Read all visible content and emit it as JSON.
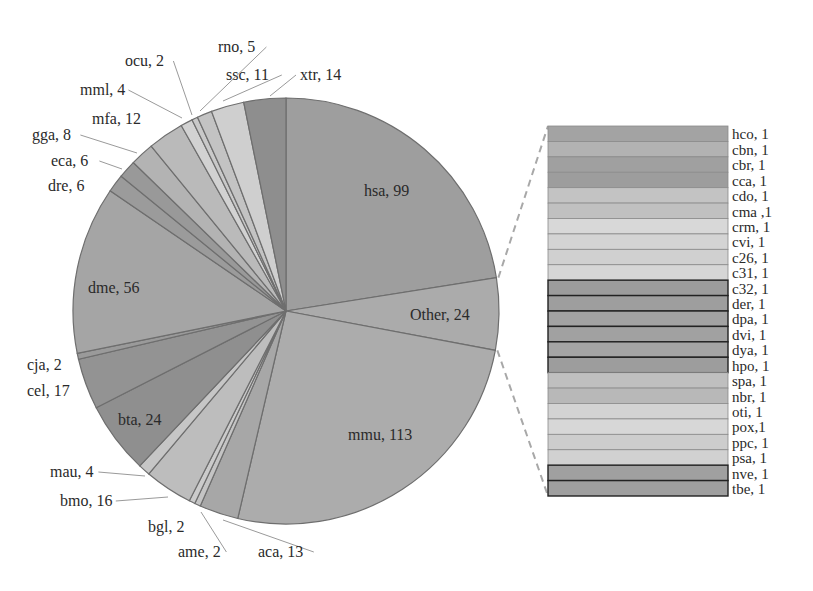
{
  "chart_data": {
    "type": "pie",
    "subtype": "pie-of-pie (bar of pie)",
    "title": "",
    "pie": {
      "order": "clockwise from 12 o'clock",
      "slices": [
        {
          "label": "hsa",
          "value": 99,
          "color": "#9e9e9e"
        },
        {
          "label": "Other",
          "value": 24,
          "color": "#ababab"
        },
        {
          "label": "mmu",
          "value": 113,
          "color": "#acacac"
        },
        {
          "label": "aca",
          "value": 13,
          "color": "#a7a7a7"
        },
        {
          "label": "ame",
          "value": 2,
          "color": "#c4c4c4"
        },
        {
          "label": "bgl",
          "value": 2,
          "color": "#cbcbcb"
        },
        {
          "label": "bmo",
          "value": 16,
          "color": "#bdbdbd"
        },
        {
          "label": "mau",
          "value": 4,
          "color": "#c6c6c6"
        },
        {
          "label": "bta",
          "value": 24,
          "color": "#8f8f8f"
        },
        {
          "label": "cel",
          "value": 17,
          "color": "#939393"
        },
        {
          "label": "cja",
          "value": 2,
          "color": "#9a9a9a"
        },
        {
          "label": "dme",
          "value": 56,
          "color": "#a5a5a5"
        },
        {
          "label": "dre",
          "value": 6,
          "color": "#9b9b9b"
        },
        {
          "label": "eca",
          "value": 6,
          "color": "#999999"
        },
        {
          "label": "gga",
          "value": 8,
          "color": "#b3b3b3"
        },
        {
          "label": "mfa",
          "value": 12,
          "color": "#bababa"
        },
        {
          "label": "mml",
          "value": 4,
          "color": "#d2d2d2"
        },
        {
          "label": "ocu",
          "value": 2,
          "color": "#c9c9c9"
        },
        {
          "label": "rno",
          "value": 5,
          "color": "#c3c3c3"
        },
        {
          "label": "ssc",
          "value": 11,
          "color": "#cfcfcf"
        },
        {
          "label": "xtr",
          "value": 14,
          "color": "#8e8e8e"
        }
      ],
      "labels_display": [
        {
          "text": "hsa, 99",
          "x": 364,
          "y": 196,
          "inside": true
        },
        {
          "text": "Other, 24",
          "x": 410,
          "y": 320,
          "inside": true
        },
        {
          "text": "mmu, 113",
          "x": 348,
          "y": 440,
          "inside": true
        },
        {
          "text": "dme, 56",
          "x": 88,
          "y": 293,
          "inside": true
        },
        {
          "text": "bta, 24",
          "x": 118,
          "y": 425,
          "inside": true
        },
        {
          "text": "xtr, 14",
          "x": 300,
          "y": 80,
          "lx": 270,
          "ly": 96
        },
        {
          "text": "ssc, 11",
          "x": 226,
          "y": 80,
          "lx": 223,
          "ly": 101
        },
        {
          "text": "rno, 5",
          "x": 218,
          "y": 52,
          "lx": 200,
          "ly": 111
        },
        {
          "text": "ocu, 2",
          "x": 125,
          "y": 66,
          "lx": 192,
          "ly": 115
        },
        {
          "text": "mml, 4",
          "x": 80,
          "y": 95,
          "lx": 182,
          "ly": 118
        },
        {
          "text": "mfa, 12",
          "x": 92,
          "y": 124,
          "lx": null,
          "ly": null
        },
        {
          "text": "gga, 8",
          "x": 32,
          "y": 140,
          "lx": 137,
          "ly": 153
        },
        {
          "text": "eca, 6",
          "x": 51,
          "y": 166,
          "lx": 122,
          "ly": 169
        },
        {
          "text": "dre, 6",
          "x": 48,
          "y": 191,
          "lx": null,
          "ly": null
        },
        {
          "text": "cja, 2",
          "x": 27,
          "y": 370,
          "lx": null,
          "ly": null
        },
        {
          "text": "cel, 17",
          "x": 27,
          "y": 396,
          "lx": null,
          "ly": null
        },
        {
          "text": "mau, 4",
          "x": 50,
          "y": 477,
          "lx": 145,
          "ly": 476
        },
        {
          "text": "bmo, 16",
          "x": 60,
          "y": 506,
          "lx": 168,
          "ly": 497
        },
        {
          "text": "bgl, 2",
          "x": 148,
          "y": 532,
          "lx": null,
          "ly": null
        },
        {
          "text": "ame, 2",
          "x": 178,
          "y": 557,
          "lx": 201,
          "ly": 512
        },
        {
          "text": "aca, 13",
          "x": 258,
          "y": 557,
          "lx": 223,
          "ly": 520
        }
      ]
    },
    "breakdown_bar": {
      "of_slice": "Other",
      "total": 24,
      "items": [
        {
          "label": "hco, 1",
          "name": "hco",
          "value": 1,
          "color": "#a3a3a3",
          "bold": false
        },
        {
          "label": "cbn, 1",
          "name": "cbn",
          "value": 1,
          "color": "#b2b2b2",
          "bold": false
        },
        {
          "label": "cbr, 1",
          "name": "cbr",
          "value": 1,
          "color": "#a0a0a0",
          "bold": false
        },
        {
          "label": "cca, 1",
          "name": "cca",
          "value": 1,
          "color": "#9d9d9d",
          "bold": false
        },
        {
          "label": "cdo, 1",
          "name": "cdo",
          "value": 1,
          "color": "#c3c3c3",
          "bold": false
        },
        {
          "label": "cma ,1",
          "name": "cma",
          "value": 1,
          "color": "#c0c0c0",
          "bold": false
        },
        {
          "label": "crm, 1",
          "name": "crm",
          "value": 1,
          "color": "#d8d8d8",
          "bold": false
        },
        {
          "label": "cvi, 1",
          "name": "cvi",
          "value": 1,
          "color": "#d4d4d4",
          "bold": false
        },
        {
          "label": "c26, 1",
          "name": "c26",
          "value": 1,
          "color": "#d0d0d0",
          "bold": false
        },
        {
          "label": "c31, 1",
          "name": "c31",
          "value": 1,
          "color": "#d6d6d6",
          "bold": false
        },
        {
          "label": "c32, 1",
          "name": "c32",
          "value": 1,
          "color": "#9c9c9c",
          "bold": true
        },
        {
          "label": "der, 1",
          "name": "der",
          "value": 1,
          "color": "#9e9e9e",
          "bold": true
        },
        {
          "label": "dpa, 1",
          "name": "dpa",
          "value": 1,
          "color": "#a2a2a2",
          "bold": true
        },
        {
          "label": "dvi, 1",
          "name": "dvi",
          "value": 1,
          "color": "#a1a1a1",
          "bold": true
        },
        {
          "label": "dya, 1",
          "name": "dya",
          "value": 1,
          "color": "#a4a4a4",
          "bold": true
        },
        {
          "label": "hpo, 1",
          "name": "hpo",
          "value": 1,
          "color": "#9d9d9d",
          "bold": true
        },
        {
          "label": "spa, 1",
          "name": "spa",
          "value": 1,
          "color": "#bfbfbf",
          "bold": false
        },
        {
          "label": "nbr, 1",
          "name": "nbr",
          "value": 1,
          "color": "#b8b8b8",
          "bold": false
        },
        {
          "label": "oti, 1",
          "name": "oti",
          "value": 1,
          "color": "#d3d3d3",
          "bold": false
        },
        {
          "label": "pox,1",
          "name": "pox",
          "value": 1,
          "color": "#d7d7d7",
          "bold": false
        },
        {
          "label": "ppc, 1",
          "name": "ppc",
          "value": 1,
          "color": "#cdcdcd",
          "bold": false
        },
        {
          "label": "psa, 1",
          "name": "psa",
          "value": 1,
          "color": "#d1d1d1",
          "bold": false
        },
        {
          "label": "nve, 1",
          "name": "nve",
          "value": 1,
          "color": "#a0a0a0",
          "bold": true
        },
        {
          "label": "tbe, 1",
          "name": "tbe",
          "value": 1,
          "color": "#9f9f9f",
          "bold": true
        }
      ]
    },
    "legend": "none",
    "grid": false
  },
  "layout": {
    "pie_cx": 286,
    "pie_cy": 311,
    "pie_r": 213,
    "bar_x": 548,
    "bar_y": 126,
    "bar_w": 180,
    "bar_h": 370,
    "label_x": 732,
    "edge_color": "#6e6e6e",
    "connector_color": "#9a9a9a"
  }
}
